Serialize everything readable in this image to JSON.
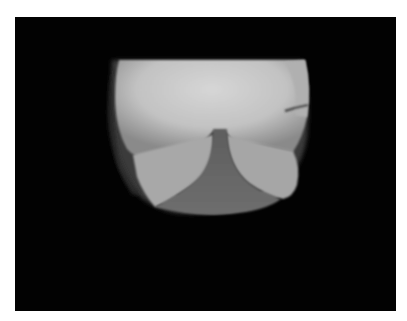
{
  "image": {
    "kind": "radiograph",
    "subject": "knee X-ray (axial / skyline view)",
    "colors": {
      "border": "#ffffff",
      "background": "#020202",
      "bone_bright": "#d2d2d2",
      "bone_mid": "#a8a8a8",
      "soft_tissue": "#6e6e6e",
      "intercondylar_notch": "#5a5a5a"
    }
  }
}
